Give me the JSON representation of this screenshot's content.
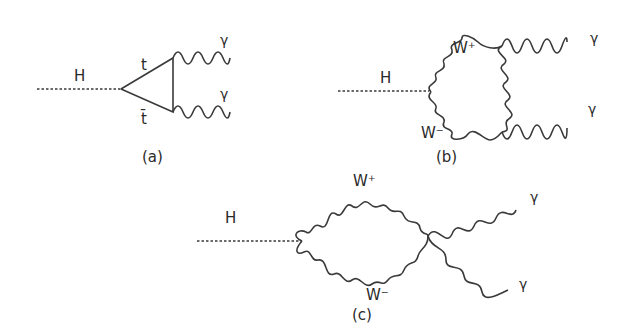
{
  "figure": {
    "panels": [
      {
        "id": "a",
        "caption": "(a)",
        "labels": {
          "higgs": "H",
          "top": "t",
          "antitop": "t̄",
          "photon1": "γ",
          "photon2": "γ"
        },
        "loop": "top quark triangle"
      },
      {
        "id": "b",
        "caption": "(b)",
        "labels": {
          "higgs": "H",
          "wplus": "W⁺",
          "wminus": "W⁻",
          "photon1": "γ",
          "photon2": "γ"
        },
        "loop": "W boson triangle"
      },
      {
        "id": "c",
        "caption": "(c)",
        "labels": {
          "higgs": "H",
          "wplus": "W⁺",
          "wminus": "W⁻",
          "photon1": "γ",
          "photon2": "γ"
        },
        "loop": "W boson bubble with quartic vertex"
      }
    ]
  }
}
